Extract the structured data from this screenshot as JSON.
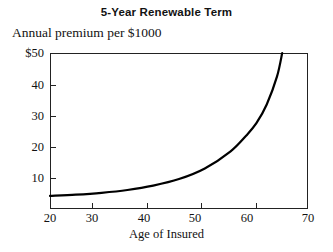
{
  "chart_data": {
    "type": "line",
    "title": "5-Year Renewable Term",
    "subtitle": "Annual premium per $1000",
    "xlabel": "Age of Insured",
    "ylabel": "Annual premium per $1000",
    "xlim": [
      20,
      70
    ],
    "ylim": [
      0,
      50
    ],
    "grid": false,
    "legend": null,
    "x_ticks": [
      {
        "value": 20,
        "label": "20"
      },
      {
        "value": 30,
        "label": "30"
      },
      {
        "value": 40,
        "label": "40"
      },
      {
        "value": 50,
        "label": "50"
      },
      {
        "value": 60,
        "label": "60"
      },
      {
        "value": 70,
        "label": "70"
      }
    ],
    "y_ticks": [
      {
        "value": 50,
        "label": "$50"
      },
      {
        "value": 40,
        "label": "40"
      },
      {
        "value": 30,
        "label": "30"
      },
      {
        "value": 20,
        "label": "20"
      },
      {
        "value": 10,
        "label": "10"
      }
    ],
    "series": [
      {
        "name": "Annual premium per $1000",
        "color": "#000000",
        "x": [
          20,
          25,
          30,
          35,
          40,
          45,
          50,
          55,
          58,
          60,
          62,
          64,
          65
        ],
        "values": [
          4.2,
          4.6,
          5.2,
          6.1,
          7.5,
          9.6,
          13.0,
          18.5,
          23.5,
          27.5,
          33.5,
          42.5,
          50.0
        ]
      }
    ]
  }
}
